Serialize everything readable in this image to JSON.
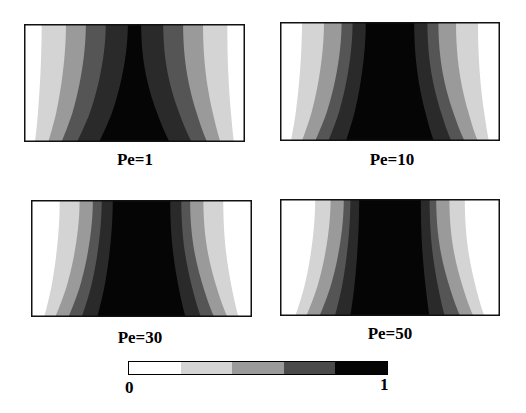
{
  "figure": {
    "panels": [
      {
        "id": "pe1",
        "label": "Pe=1",
        "box": [
          24,
          24,
          221,
          118
        ],
        "label_pos": [
          135,
          150
        ]
      },
      {
        "id": "pe10",
        "label": "Pe=10",
        "box": [
          280,
          22,
          220,
          119
        ],
        "label_pos": [
          392,
          150
        ]
      },
      {
        "id": "pe30",
        "label": "Pe=30",
        "box": [
          31,
          200,
          221,
          117
        ],
        "label_pos": [
          140,
          328
        ]
      },
      {
        "id": "pe50",
        "label": "Pe=50",
        "box": [
          280,
          199,
          220,
          117
        ],
        "label_pos": [
          390,
          324
        ]
      }
    ],
    "colorbar": {
      "min_label": "0",
      "max_label": "1",
      "levels": [
        "#ffffff",
        "#d4d4d4",
        "#9a9a9a",
        "#4a4a4a",
        "#050505"
      ]
    },
    "band_colors": [
      "#ffffff",
      "#d4d4d4",
      "#9a9a9a",
      "#555555",
      "#2a2a2a",
      "#050505"
    ]
  },
  "chart_data": {
    "type": "heatmap",
    "title": "",
    "panels": [
      "Pe=1",
      "Pe=10",
      "Pe=30",
      "Pe=50"
    ],
    "colorbar": {
      "min": 0,
      "max": 1,
      "n_levels": 5
    },
    "core_width_fraction_top": {
      "Pe=1": 0.06,
      "Pe=10": 0.22,
      "Pe=30": 0.3,
      "Pe=50": 0.36
    },
    "core_width_fraction_bottom": {
      "Pe=1": 0.45,
      "Pe=10": 0.45,
      "Pe=30": 0.45,
      "Pe=50": 0.42
    }
  }
}
